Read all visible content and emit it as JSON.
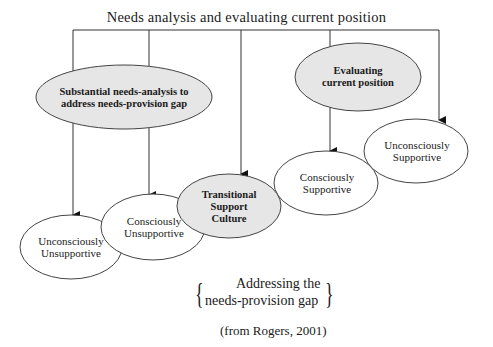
{
  "title": "Needs analysis and evaluating current position",
  "colors": {
    "line": "#333333",
    "grey_fill": "#e6e6e6",
    "white_fill": "#ffffff"
  },
  "nodes": [
    {
      "id": "substantial",
      "label_lines": [
        "Substantial needs-analysis to",
        "address needs-provision",
        "gap"
      ],
      "style": "grey",
      "cx": 124,
      "cy": 97,
      "rx": 88,
      "ry": 32
    },
    {
      "id": "evaluating",
      "label_lines": [
        "Evaluating",
        "current position"
      ],
      "style": "grey",
      "cx": 358,
      "cy": 77,
      "rx": 63,
      "ry": 34
    },
    {
      "id": "unconsciously-unsupportive",
      "label_lines": [
        "Unconsciously",
        "Unsupportive"
      ],
      "style": "white",
      "cx": 71,
      "cy": 247,
      "rx": 51,
      "ry": 32
    },
    {
      "id": "consciously-unsupportive",
      "label_lines": [
        "Consciously",
        "Unsupportive"
      ],
      "style": "white",
      "cx": 153,
      "cy": 227,
      "rx": 52,
      "ry": 33
    },
    {
      "id": "transitional",
      "label_lines": [
        "Transitional",
        "Support",
        "Culture"
      ],
      "style": "grey",
      "cx": 229,
      "cy": 206,
      "rx": 52,
      "ry": 32
    },
    {
      "id": "consciously-supportive",
      "label_lines": [
        "Consciously",
        "Supportive"
      ],
      "style": "white",
      "cx": 326,
      "cy": 183,
      "rx": 52,
      "ry": 32
    },
    {
      "id": "unconsciously-supportive",
      "label_lines": [
        "Unconsciously",
        "Supportive"
      ],
      "style": "white",
      "cx": 416,
      "cy": 151,
      "rx": 52,
      "ry": 32
    }
  ],
  "labels": {
    "substantial": "Substantial needs-analysis to address needs-provision gap",
    "evaluating": "Evaluating current position",
    "unconsciously_unsupportive": "Unconsciously Unsupportive",
    "consciously_unsupportive": "Consciously Unsupportive",
    "transitional": "Transitional Support Culture",
    "consciously_supportive": "Consciously Supportive",
    "unconsciously_supportive": "Unconsciously Supportive"
  },
  "connectors": {
    "top_bar": {
      "y": 30,
      "x1": 73,
      "x2": 439
    },
    "drops": [
      {
        "x": 73,
        "to_y": 215,
        "arrow": true
      },
      {
        "x": 149,
        "to_y": 195,
        "arrow": true
      },
      {
        "x": 241,
        "to_y": 174,
        "arrow": true
      },
      {
        "x": 330,
        "to_y": 151,
        "arrow": true
      },
      {
        "x": 439,
        "to_y": 120,
        "arrow": true
      }
    ]
  },
  "caption": {
    "line1": "Addressing the",
    "line2": "needs-provision gap",
    "brace_left": "{",
    "brace_right": "}"
  },
  "source": "(from Rogers, 2001)"
}
